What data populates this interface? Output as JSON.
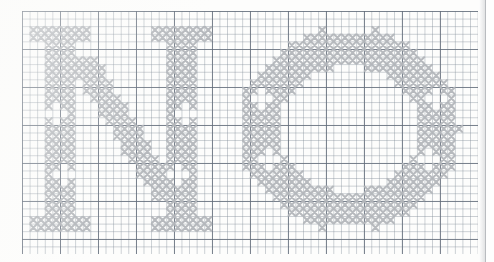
{
  "document": {
    "kind": "cross-stitch-pattern-chart",
    "medium": "graph-paper",
    "title": "NO",
    "letters": [
      "N",
      "O"
    ],
    "typeface_style": "serif capitals",
    "stitch_symbol": "x",
    "stitch_color": "#b3b6bb",
    "grid": {
      "minor_line_color": "#7884918a",
      "major_line_color": "#545f6e",
      "minor_cell_px": 7.6,
      "major_every_cells": 5,
      "columns": 60,
      "rows": 32,
      "origin_x_px": 22,
      "origin_y_px": 11
    },
    "page": {
      "background": "#fdfdfc",
      "edge_line_color": "#b9bcc0",
      "edge_x_px": 471
    }
  },
  "chart_data": {
    "type": "heatmap",
    "title": "NO",
    "xlabel": "",
    "ylabel": "",
    "legend": [],
    "cell_value_filled": 1,
    "cell_value_empty": 0,
    "columns": 60,
    "rows": 32,
    "glyphs": [
      {
        "char": "N",
        "col_start": 1,
        "col_end": 26,
        "row_start": 1,
        "row_end": 30,
        "parts": [
          "left stem",
          "top-left serif",
          "bottom-left serif",
          "diagonal",
          "right stem",
          "top-right serif",
          "bottom-right serif",
          "stem diamond voids"
        ]
      },
      {
        "char": "O",
        "col_start": 28,
        "col_end": 58,
        "row_start": 1,
        "row_end": 30,
        "parts": [
          "left bowl",
          "right bowl",
          "top arc",
          "bottom arc",
          "inner counter",
          "bowl diamond voids"
        ]
      }
    ]
  }
}
